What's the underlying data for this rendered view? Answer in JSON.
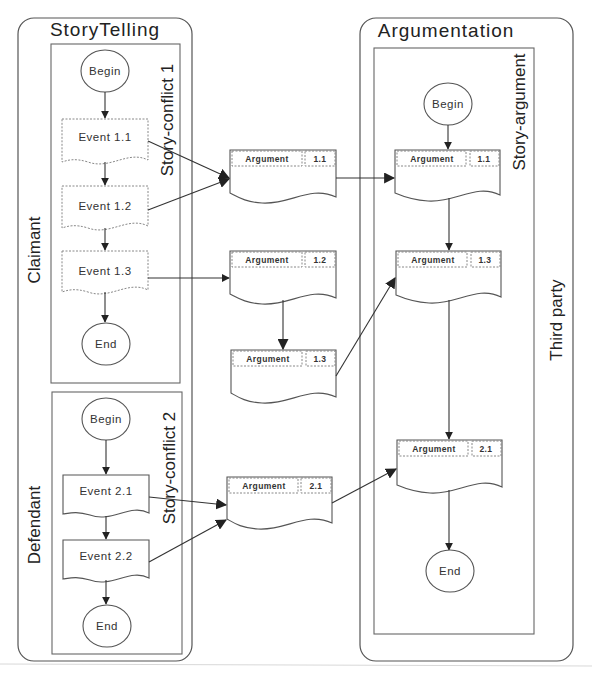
{
  "storytelling": {
    "title": "StoryTelling",
    "lanes": [
      {
        "label": "Claimant",
        "conflict_label": "Story-conflict 1",
        "nodes": [
          "Begin",
          "Event 1.1",
          "Event 1.2",
          "Event 1.3",
          "End"
        ]
      },
      {
        "label": "Defendant",
        "conflict_label": "Story-conflict 2",
        "nodes": [
          "Begin",
          "Event 2.1",
          "Event 2.2",
          "End"
        ]
      }
    ]
  },
  "middle_arguments": [
    {
      "label": "Argument",
      "id": "1.1"
    },
    {
      "label": "Argument",
      "id": "1.2"
    },
    {
      "label": "Argument",
      "id": "1.3"
    },
    {
      "label": "Argument",
      "id": "2.1"
    }
  ],
  "argumentation": {
    "title": "Argumentation",
    "lane_label": "Third party",
    "story_label": "Story-argument",
    "begin": "Begin",
    "end": "End",
    "arguments": [
      {
        "label": "Argument",
        "id": "1.1"
      },
      {
        "label": "Argument",
        "id": "1.3"
      },
      {
        "label": "Argument",
        "id": "2.1"
      }
    ]
  },
  "edges": [
    "Event 1.1 -> Argument 1.1 (middle)",
    "Event 1.2 -> Argument 1.1 (middle)",
    "Event 1.3 -> Argument 1.2 (middle)",
    "Argument 1.2 -> Argument 1.3 (middle)",
    "Event 2.1 -> Argument 2.1 (middle)",
    "Event 2.2 -> Argument 2.1 (middle)",
    "Argument 1.1 (middle) -> Argument 1.1 (story)",
    "Argument 1.3 (middle) -> Argument 1.3 (story)",
    "Argument 2.1 (middle) -> Argument 2.1 (story)"
  ]
}
